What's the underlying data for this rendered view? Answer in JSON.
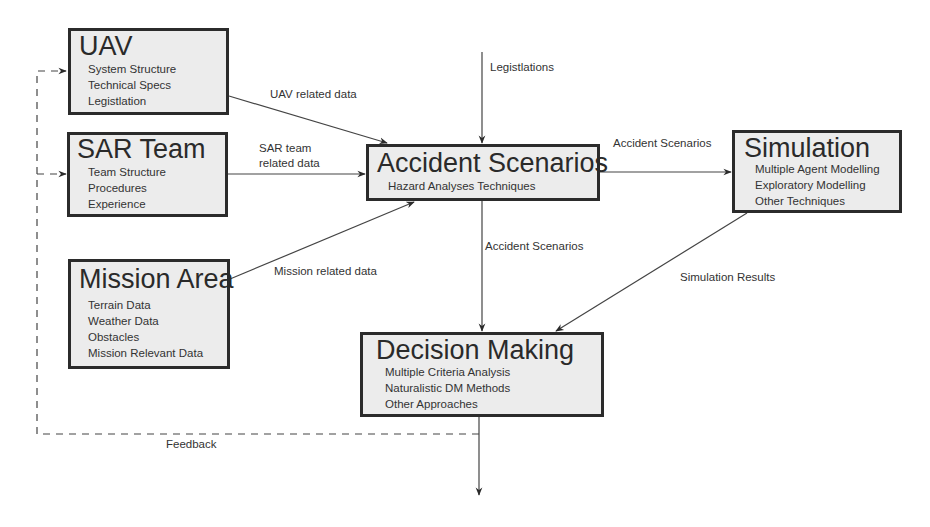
{
  "diagram": {
    "nodes": {
      "uav": {
        "title": "UAV",
        "items": [
          "System Structure",
          "Technical Specs",
          "Legistlation"
        ]
      },
      "sar_team": {
        "title": "SAR Team",
        "items": [
          "Team Structure",
          "Procedures",
          "Experience"
        ]
      },
      "mission_area": {
        "title": "Mission Area",
        "items": [
          "Terrain Data",
          "Weather Data",
          "Obstacles",
          "Mission Relevant Data"
        ]
      },
      "accident_scenarios": {
        "title": "Accident Scenarios",
        "items": [
          "Hazard Analyses Techniques"
        ]
      },
      "simulation": {
        "title": "Simulation",
        "items": [
          "Multiple Agent Modelling",
          "Exploratory Modelling",
          "Other Techniques"
        ]
      },
      "decision_making": {
        "title": "Decision Making",
        "items": [
          "Multiple Criteria Analysis",
          "Naturalistic DM Methods",
          "Other Approaches"
        ]
      }
    },
    "edges": {
      "legislations": "Legistlations",
      "uav_data": "UAV related data",
      "sar_data_line1": "SAR team",
      "sar_data_line2": "related data",
      "mission_data": "Mission related data",
      "accident_to_sim": "Accident Scenarios",
      "accident_to_decision": "Accident Scenarios",
      "sim_results": "Simulation Results",
      "feedback": "Feedback"
    }
  }
}
